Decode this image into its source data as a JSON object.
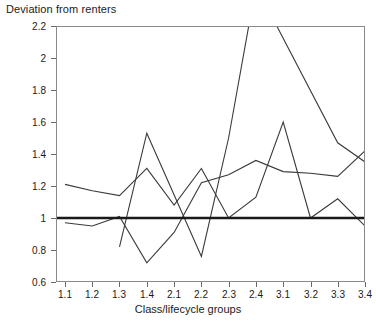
{
  "chart_data": {
    "type": "line",
    "title": "Deviation from renters",
    "xlabel": "Class/lifecycle groups",
    "ylabel": "",
    "categories": [
      "1.1",
      "1.2",
      "1.3",
      "1.4",
      "2.1",
      "2.2",
      "2.3",
      "2.4",
      "3.1",
      "3.2",
      "3.3",
      "3.4"
    ],
    "ylim": [
      0.6,
      2.2
    ],
    "yticks": [
      "0.6",
      "0.8",
      "1",
      "1.2",
      "1.4",
      "1.6",
      "1.8",
      "2",
      "2.2"
    ],
    "ytick_values": [
      0.6,
      0.8,
      1.0,
      1.2,
      1.4,
      1.6,
      1.8,
      2.0,
      2.2
    ],
    "grid": false,
    "legend": "none",
    "reference_line": {
      "value": 1.0,
      "style": "thick-solid-black",
      "label": "renters baseline"
    },
    "series": [
      {
        "name": "Series 1",
        "values": [
          1.21,
          1.17,
          1.14,
          1.31,
          1.08,
          1.31,
          1.0,
          1.13,
          1.6,
          1.0,
          1.12,
          0.95
        ]
      },
      {
        "name": "Series 2",
        "values": [
          0.97,
          0.95,
          1.01,
          0.72,
          0.91,
          1.22,
          1.27,
          1.36,
          1.29,
          1.28,
          1.26,
          1.42
        ]
      },
      {
        "name": "Series 3",
        "values": [
          null,
          null,
          0.82,
          1.53,
          null,
          0.76,
          1.5,
          2.45,
          null,
          null,
          1.47,
          1.35
        ]
      }
    ]
  }
}
